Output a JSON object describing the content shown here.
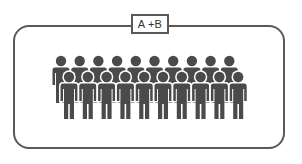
{
  "group": {
    "label": "A+B",
    "label_display": "A +B",
    "figure_icon": "person-icon",
    "back_row_count": 10,
    "front_row_count": 10,
    "total_figures": 20
  },
  "colors": {
    "frame": "#595959",
    "figure": "#4a4a4a",
    "background": "#ffffff"
  }
}
